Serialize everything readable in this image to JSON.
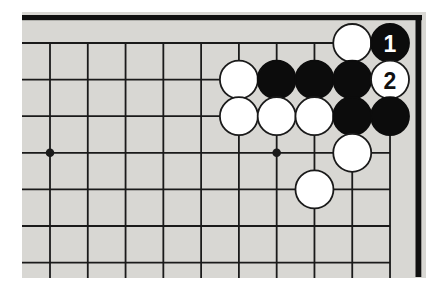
{
  "page": {
    "background": "#ffffff"
  },
  "board": {
    "background": "#d8d7d3",
    "line_color": "#1a1a1a",
    "edge_color": "#101010",
    "white_stone_color": "#ffffff",
    "black_stone_color": "#0c0c0c",
    "label_on_black_color": "#ffffff",
    "label_on_white_color": "#111111",
    "position": {
      "left": 22,
      "top": 12,
      "width": 404,
      "height": 266
    },
    "grid": {
      "cols": 10,
      "rows": 7,
      "x0": 28,
      "y0": 31,
      "dx": 37.78,
      "dy": 36.6,
      "h_line_x2": 368,
      "v_line_y2": 266,
      "line_width": 1.8
    },
    "edges": {
      "top": {
        "x": 0,
        "y": 3,
        "w": 400,
        "h": 5.2
      },
      "right": {
        "x": 393.5,
        "y": 3,
        "w": 5.8,
        "h": 262
      }
    },
    "star_point_radius": 4.3,
    "star_points": [
      {
        "col": 0,
        "row": 3
      },
      {
        "col": 6,
        "row": 3
      }
    ],
    "stone_radius": 19,
    "stone_stroke_width": 1.8,
    "label_font_size": 23,
    "stones": [
      {
        "col": 8,
        "row": 0,
        "color": "white",
        "label": ""
      },
      {
        "col": 9,
        "row": 0,
        "color": "black",
        "label": "1"
      },
      {
        "col": 5,
        "row": 1,
        "color": "white",
        "label": ""
      },
      {
        "col": 6,
        "row": 1,
        "color": "black",
        "label": ""
      },
      {
        "col": 7,
        "row": 1,
        "color": "black",
        "label": ""
      },
      {
        "col": 8,
        "row": 1,
        "color": "black",
        "label": ""
      },
      {
        "col": 9,
        "row": 1,
        "color": "white",
        "label": "2"
      },
      {
        "col": 5,
        "row": 2,
        "color": "white",
        "label": ""
      },
      {
        "col": 6,
        "row": 2,
        "color": "white",
        "label": ""
      },
      {
        "col": 7,
        "row": 2,
        "color": "white",
        "label": ""
      },
      {
        "col": 8,
        "row": 2,
        "color": "black",
        "label": ""
      },
      {
        "col": 9,
        "row": 2,
        "color": "black",
        "label": ""
      },
      {
        "col": 8,
        "row": 3,
        "color": "white",
        "label": ""
      },
      {
        "col": 7,
        "row": 4,
        "color": "white",
        "label": ""
      }
    ]
  }
}
